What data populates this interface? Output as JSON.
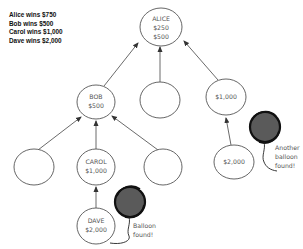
{
  "legend": {
    "lines": [
      "Alice wins $750",
      "Bob wins $500",
      "Carol wins $1,000",
      "Dave wins $2,000"
    ]
  },
  "nodes": {
    "alice": {
      "line1": "ALICE",
      "line2": "$250",
      "line3": "$500"
    },
    "bob": {
      "line1": "BOB",
      "line2": "$500"
    },
    "middle_empty": {},
    "right_top": {
      "line1": "$1,000"
    },
    "left_empty": {},
    "carol": {
      "line1": "CAROL",
      "line2": "$1,000"
    },
    "right_empty": {},
    "right_bottom": {
      "line1": "$2,000"
    },
    "dave": {
      "line1": "DAVE",
      "line2": "$2,000"
    }
  },
  "annotations": {
    "balloon1": {
      "line1": "Balloon",
      "line2": "found!"
    },
    "balloon2": {
      "line1": "Another",
      "line2": "balloon",
      "line3": "found!"
    }
  },
  "colors": {
    "stroke": "#555555",
    "arrow": "#333333",
    "balloon_fill": "#555555",
    "balloon_edge": "#111111"
  }
}
